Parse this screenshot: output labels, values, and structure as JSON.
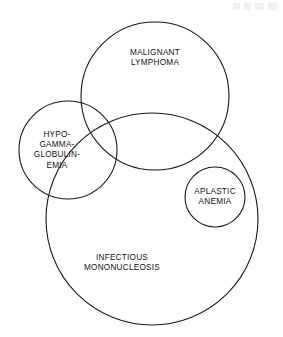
{
  "figure": {
    "type": "venn-diagram",
    "background_color": "#ffffff",
    "stroke_color": "#1a1a1a",
    "text_color": "#101010",
    "width": 283,
    "height": 337
  },
  "sets": [
    {
      "id": "malignant-lymphoma",
      "label": "MALIGNANT\nLYMPHOMA",
      "label_lines": [
        "MALIGNANT",
        "LYMPHOMA"
      ],
      "cx": 155,
      "cy": 96,
      "r": 74,
      "label_x": 155,
      "label_y": 58
    },
    {
      "id": "hypogammaglobulinemia",
      "label": "HYPO-\nGAMMA-\nGLOBULIN-\nEMIA",
      "label_lines": [
        "HYPO-",
        "GAMMA-",
        "GLOBULIN-",
        "EMIA"
      ],
      "cx": 68,
      "cy": 150,
      "r": 49,
      "label_x": 57,
      "label_y": 150
    },
    {
      "id": "aplastic-anemia",
      "label": "APLASTIC\nANEMIA",
      "label_lines": [
        "APLASTIC",
        "ANEMIA"
      ],
      "cx": 215,
      "cy": 197,
      "r": 30,
      "label_x": 215,
      "label_y": 197
    },
    {
      "id": "infectious-mononucleosis",
      "label": "INFECTIOUS\nMONONUCLEOSIS",
      "label_lines": [
        "INFECTIOUS",
        "MONONUCLEOSIS"
      ],
      "cx": 152,
      "cy": 219,
      "r": 106,
      "label_x": 122,
      "label_y": 263
    }
  ]
}
